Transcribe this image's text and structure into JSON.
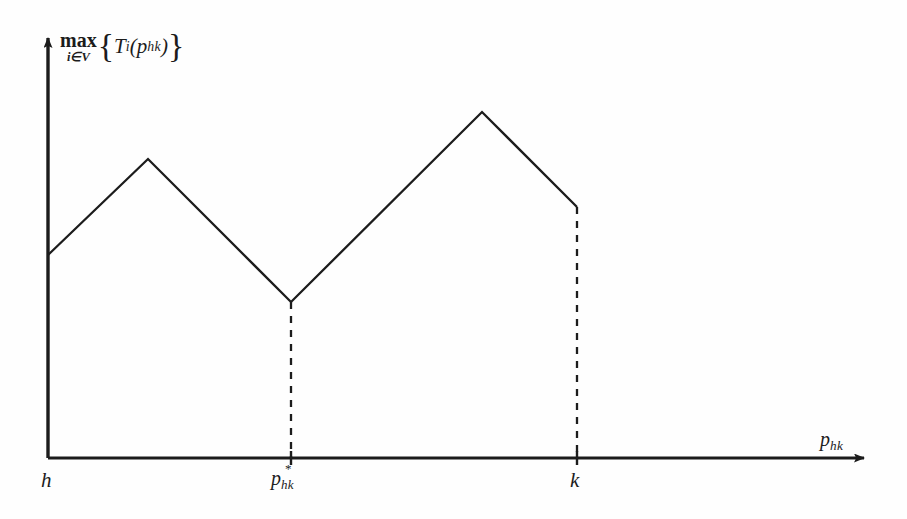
{
  "figure": {
    "background_color": "#fefefe",
    "line_color": "#1c1c1c",
    "axis_color": "#1c1c1c",
    "y_axis_label": {
      "operator": "max",
      "operator_subscript": "i∈V",
      "brace_open": "{",
      "function_name": "T",
      "function_subscript": "i",
      "paren_open": "(",
      "argument_base": "p",
      "argument_subscript": "hk",
      "paren_close": ")",
      "brace_close": "}",
      "plain": "max_{i∈V}{T_i(p_hk)}"
    },
    "x_axis_label": {
      "base": "p",
      "subscript": "hk",
      "plain": "p_hk"
    },
    "tick_labels": [
      {
        "name": "h",
        "base": "h",
        "superscript": "",
        "subscript": "",
        "x": 48
      },
      {
        "name": "p-star-hk",
        "base": "p",
        "superscript": "*",
        "subscript": "hk",
        "x": 291
      },
      {
        "name": "k",
        "base": "k",
        "superscript": "",
        "subscript": "",
        "x": 577
      }
    ]
  },
  "chart_data": {
    "type": "line",
    "title": "",
    "subtitle": "",
    "xlabel": "p_hk",
    "ylabel": "max_{i∈V}{T_i(p_hk)}",
    "grid": false,
    "legend": "none",
    "axis_style": "arrow-ended half-axes (open ranges, no numeric ticks)",
    "xlim": [
      48,
      870
    ],
    "ylim": [
      32,
      458
    ],
    "x_tick_positions": [
      48,
      291,
      577
    ],
    "x_tick_labels": [
      "h",
      "p*_hk",
      "k"
    ],
    "y_tick_positions": [],
    "y_tick_labels": [],
    "series": [
      {
        "name": "max_{i in V} T_i(p_hk)",
        "style": "solid",
        "points": [
          {
            "label": "start-at-h",
            "x": 48,
            "y": 255
          },
          {
            "label": "local-peak-1",
            "x": 148,
            "y": 159
          },
          {
            "label": "global-minimum-at-p-star",
            "x": 291,
            "y": 302
          },
          {
            "label": "local-peak-2",
            "x": 482,
            "y": 112
          },
          {
            "label": "end-at-k",
            "x": 577,
            "y": 207
          }
        ]
      }
    ],
    "dashed_droplines": [
      {
        "name": "dropline-p-star",
        "x": 291,
        "y_top": 302,
        "y_bottom": 458
      },
      {
        "name": "dropline-k",
        "x": 577,
        "y_top": 207,
        "y_bottom": 458
      }
    ],
    "axes": {
      "origin": {
        "x": 48,
        "y": 458
      },
      "x_axis": {
        "from_x": 48,
        "to_x": 870,
        "y": 458,
        "arrow": true
      },
      "y_axis": {
        "x": 48,
        "from_y": 458,
        "to_y": 32,
        "arrow": true
      }
    }
  }
}
